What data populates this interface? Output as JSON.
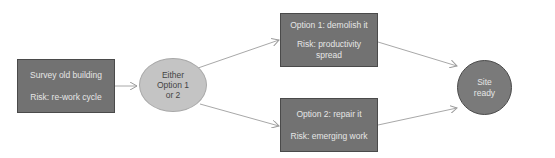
{
  "diagram": {
    "nodes": {
      "survey": {
        "title": "Survey old building",
        "risk": "Risk: re-work cycle"
      },
      "decision": {
        "line1": "Either",
        "line2": "Option 1",
        "line3": "or 2"
      },
      "option1": {
        "title": "Option 1: demolish it",
        "risk_line1": "Risk: productivity",
        "risk_line2": "spread"
      },
      "option2": {
        "title": "Option 2: repair it",
        "risk": "Risk: emerging work"
      },
      "site_ready": {
        "line1": "Site",
        "line2": "ready"
      }
    },
    "edges": [
      {
        "from": "survey",
        "to": "decision"
      },
      {
        "from": "decision",
        "to": "option1"
      },
      {
        "from": "decision",
        "to": "option2"
      },
      {
        "from": "option1",
        "to": "site_ready"
      },
      {
        "from": "option2",
        "to": "site_ready"
      }
    ],
    "colors": {
      "box_fill": "#727272",
      "box_border": "#4a4a4a",
      "ellipse_fill": "#c4c4c4",
      "circle_fill": "#7a7a7a",
      "edge": "#a0a0a0"
    }
  }
}
